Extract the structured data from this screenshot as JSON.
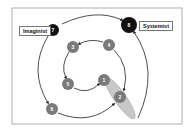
{
  "diagram": {
    "labels": {
      "imaginist": "Imaginist",
      "systemist": "Systemist"
    },
    "nodes": [
      {
        "id": "1",
        "label": "1",
        "x": 104,
        "y": 80,
        "r": 6,
        "fill": "#7a7a7a"
      },
      {
        "id": "2",
        "label": "2",
        "x": 120,
        "y": 97,
        "r": 6,
        "fill": "#7a7a7a"
      },
      {
        "id": "3",
        "label": "3",
        "x": 73,
        "y": 47,
        "r": 6,
        "fill": "#7a7a7a"
      },
      {
        "id": "4",
        "label": "4",
        "x": 109,
        "y": 45,
        "r": 6,
        "fill": "#7a7a7a"
      },
      {
        "id": "5",
        "label": "5",
        "x": 68,
        "y": 84,
        "r": 6,
        "fill": "#7a7a7a"
      },
      {
        "id": "6",
        "label": "6",
        "x": 52,
        "y": 109,
        "r": 6,
        "fill": "#7a7a7a"
      },
      {
        "id": "7",
        "label": "7",
        "x": 53,
        "y": 30,
        "r": 6,
        "fill": "#111111"
      },
      {
        "id": "8",
        "label": "8",
        "x": 129,
        "y": 25,
        "r": 8,
        "fill": "#111111"
      }
    ],
    "colors": {
      "frame": "#999999",
      "line": "#222222",
      "ellipse": "#c8c8c8"
    }
  }
}
